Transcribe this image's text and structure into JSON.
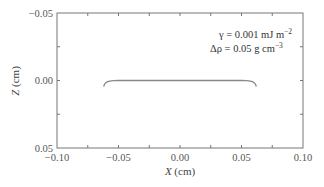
{
  "chart_data": {
    "type": "line",
    "title": "",
    "xlabel": "X (cm)",
    "ylabel": "Z (cm)",
    "xlim": [
      -0.1,
      0.1
    ],
    "ylim": [
      0.05,
      -0.05
    ],
    "y_inverted": true,
    "grid": false,
    "legend": null,
    "x_ticks": [
      "-0.10",
      "-0.05",
      "0.00",
      "0.05",
      "0.10"
    ],
    "y_ticks": [
      "-0.05",
      "0.00",
      "0.05"
    ],
    "x_minor_tick_step": 0.025,
    "y_minor_tick_step": 0.025,
    "annotations": [
      "γ = 0.001 mJ m⁻²",
      "Δρ = 0.05 g cm⁻³"
    ],
    "series": [
      {
        "name": "drop profile",
        "color": "#888888",
        "x": [
          -0.062,
          -0.0615,
          -0.0605,
          -0.059,
          -0.057,
          -0.054,
          -0.05,
          -0.03,
          0.0,
          0.03,
          0.05,
          0.054,
          0.057,
          0.059,
          0.0605,
          0.0615,
          0.062
        ],
        "z": [
          0.0045,
          0.003,
          0.0018,
          0.0009,
          0.0004,
          0.0001,
          0.0,
          0.0,
          0.0,
          0.0,
          0.0,
          0.0001,
          0.0004,
          0.0009,
          0.0018,
          0.003,
          0.0045
        ]
      }
    ]
  },
  "labels": {
    "xlabel_italic": "X",
    "xlabel_unit": " (cm)",
    "ylabel_italic": "Z",
    "ylabel_unit": " (cm)",
    "annot_gamma": "γ = 0.001 mJ m",
    "annot_gamma_exp": "−2",
    "annot_rho": "Δρ = 0.05 g cm",
    "annot_rho_exp": "−3"
  }
}
